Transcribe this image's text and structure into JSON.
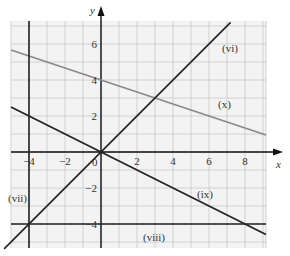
{
  "figure": {
    "x_axis_label": "x",
    "y_axis_label": "y",
    "origin_label": "0",
    "x_ticks": [
      {
        "value": -4,
        "label": "−4"
      },
      {
        "value": -2,
        "label": "−2"
      },
      {
        "value": 2,
        "label": "2"
      },
      {
        "value": 4,
        "label": "4"
      },
      {
        "value": 6,
        "label": "6"
      },
      {
        "value": 8,
        "label": "8"
      }
    ],
    "y_ticks": [
      {
        "value": 6,
        "label": "6"
      },
      {
        "value": 4,
        "label": "4"
      },
      {
        "value": 2,
        "label": "2"
      },
      {
        "value": -2,
        "label": "−2"
      },
      {
        "value": -4,
        "label": "−4"
      }
    ],
    "lines": [
      {
        "id": "vi",
        "label": "(vi)",
        "equation": "y = x",
        "color": "#222222"
      },
      {
        "id": "vii",
        "label": "(vii)",
        "equation": "x = -4",
        "color": "#222222"
      },
      {
        "id": "viii",
        "label": "(viii)",
        "equation": "y = -4",
        "color": "#222222"
      },
      {
        "id": "ix",
        "label": "(ix)",
        "equation": "y = -x/2",
        "color": "#222222"
      },
      {
        "id": "x",
        "label": "(x)",
        "equation": "y = 4 - x/3",
        "color": "#8a8a8a"
      }
    ],
    "grid_color": "#c8c8c8",
    "grid_background": "#f2f2f2"
  },
  "chart_data": {
    "type": "line",
    "title": "",
    "xlabel": "x",
    "ylabel": "y",
    "xlim": [
      -5,
      9.2
    ],
    "ylim": [
      -5.3,
      7.3
    ],
    "grid": true,
    "series": [
      {
        "name": "(vi)",
        "equation": "y = x",
        "x": [
          -5.3,
          7.2
        ],
        "y": [
          -5.3,
          7.2
        ]
      },
      {
        "name": "(vii)",
        "equation": "x = -4",
        "x": [
          -4,
          -4
        ],
        "y": [
          -5.3,
          7.3
        ]
      },
      {
        "name": "(viii)",
        "equation": "y = -4",
        "x": [
          -5,
          9.2
        ],
        "y": [
          -4,
          -4
        ]
      },
      {
        "name": "(ix)",
        "equation": "y = -x/2",
        "x": [
          -5,
          9.2
        ],
        "y": [
          2.5,
          -4.6
        ]
      },
      {
        "name": "(x)",
        "equation": "y = 4 - x/3",
        "x": [
          -5,
          9.2
        ],
        "y": [
          5.67,
          0.93
        ]
      }
    ]
  }
}
